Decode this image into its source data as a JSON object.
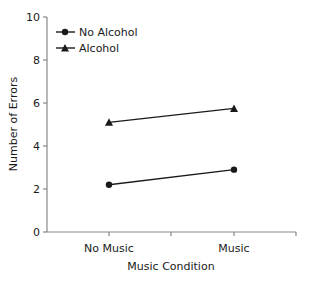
{
  "chart_data": {
    "type": "line",
    "title": "",
    "xlabel": "Music Condition",
    "ylabel": "Number of Errors",
    "categories": [
      "No Music",
      "Music"
    ],
    "ylim": [
      0,
      10
    ],
    "yticks": [
      0,
      2,
      4,
      6,
      8,
      10
    ],
    "grid": false,
    "legend_position": "upper-left",
    "series": [
      {
        "name": "No Alcohol",
        "marker": "circle",
        "values": [
          2.2,
          2.9
        ]
      },
      {
        "name": "Alcohol",
        "marker": "triangle",
        "values": [
          5.1,
          5.75
        ]
      }
    ]
  },
  "colors": {
    "line": "#1a1a1a",
    "axis": "#888888"
  }
}
